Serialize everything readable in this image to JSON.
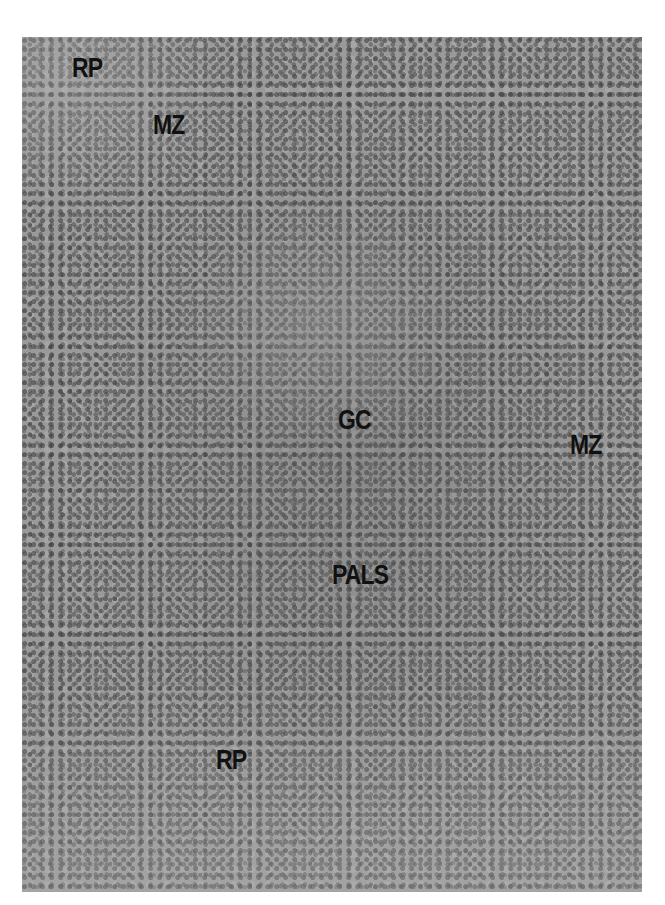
{
  "image": {
    "type": "grayscale histology micrograph",
    "subject": "spleen white pulp (lymphoid follicle)"
  },
  "labels": [
    {
      "text": "RP",
      "x": 72,
      "y": 70
    },
    {
      "text": "MZ",
      "x": 153,
      "y": 127
    },
    {
      "text": "GC",
      "x": 338,
      "y": 422
    },
    {
      "text": "MZ",
      "x": 570,
      "y": 447
    },
    {
      "text": "PALS",
      "x": 332,
      "y": 577
    },
    {
      "text": "RP",
      "x": 216,
      "y": 762
    }
  ]
}
